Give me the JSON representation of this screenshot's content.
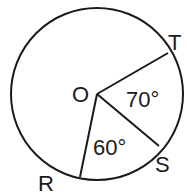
{
  "diagram": {
    "type": "circle-geometry",
    "circle": {
      "center_label": "O",
      "cx": 97,
      "cy": 94,
      "r": 86
    },
    "radii": [
      {
        "to": "T",
        "x": 168,
        "y": 53
      },
      {
        "to": "S",
        "x": 159,
        "y": 146
      },
      {
        "to": "R",
        "x": 80,
        "y": 177
      }
    ],
    "points": {
      "O": "O",
      "T": "T",
      "S": "S",
      "R": "R"
    },
    "angles": {
      "TOS": "70°",
      "SOR": "60°"
    },
    "colors": {
      "stroke": "#1a1a1a",
      "background": "#ffffff"
    }
  }
}
